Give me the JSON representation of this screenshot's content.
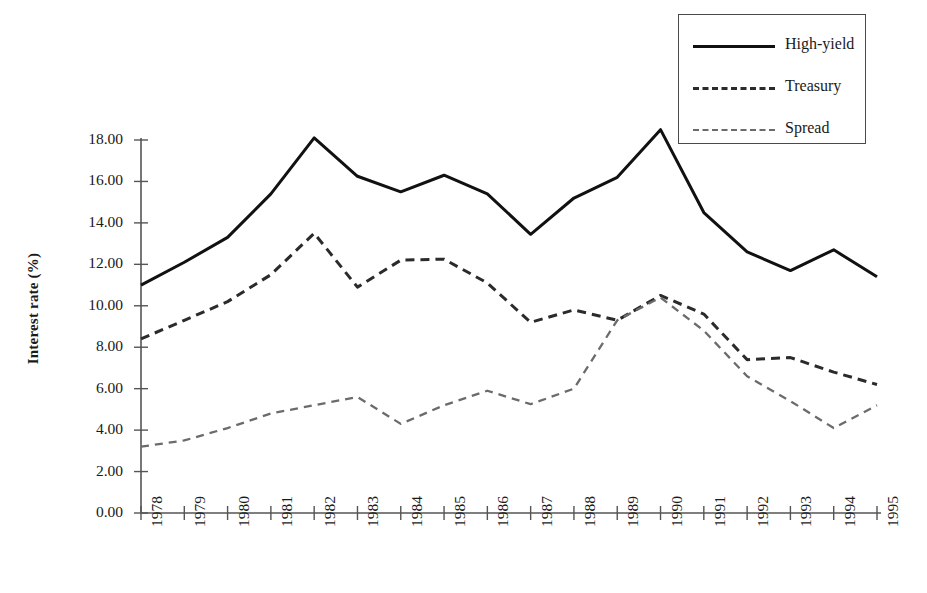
{
  "chart_data": {
    "type": "line",
    "title": "",
    "xlabel": "",
    "ylabel": "Interest rate (%)",
    "x": [
      1978,
      1979,
      1980,
      1981,
      1982,
      1983,
      1984,
      1985,
      1986,
      1987,
      1988,
      1989,
      1990,
      1991,
      1992,
      1993,
      1994,
      1995
    ],
    "categories": [
      "1978",
      "1979",
      "1980",
      "1981",
      "1982",
      "1983",
      "1984",
      "1985",
      "1986",
      "1987",
      "1988",
      "1989",
      "1990",
      "1991",
      "1992",
      "1993",
      "1994",
      "1995"
    ],
    "ylim": [
      0,
      18
    ],
    "xlim": [
      1978,
      1995
    ],
    "ytick_labels": [
      "0.00",
      "2.00",
      "4.00",
      "6.00",
      "8.00",
      "10.00",
      "12.00",
      "14.00",
      "16.00",
      "18.00"
    ],
    "ytick_values": [
      0,
      2,
      4,
      6,
      8,
      10,
      12,
      14,
      16,
      18
    ],
    "grid": false,
    "legend_position": "top-right",
    "series": [
      {
        "name": "High-yield",
        "style": "solid",
        "color": "#111111",
        "values": [
          11.0,
          12.1,
          13.3,
          15.4,
          18.1,
          16.25,
          15.5,
          16.3,
          15.4,
          13.45,
          15.2,
          16.2,
          18.5,
          14.5,
          12.6,
          11.7,
          12.7,
          11.4
        ]
      },
      {
        "name": "Treasury",
        "style": "dashed",
        "color": "#2b2b2b",
        "values": [
          8.4,
          9.3,
          10.2,
          11.5,
          13.5,
          10.9,
          12.2,
          12.25,
          11.1,
          9.2,
          9.8,
          9.3,
          10.5,
          9.6,
          7.4,
          7.5,
          6.8,
          6.2
        ]
      },
      {
        "name": "Spread",
        "style": "dashed-thin",
        "color": "#6b6b6b",
        "values": [
          3.2,
          3.5,
          4.1,
          4.8,
          5.2,
          5.6,
          4.3,
          5.2,
          5.9,
          5.25,
          6.0,
          9.3,
          10.4,
          8.8,
          6.6,
          5.4,
          4.1,
          5.2
        ]
      }
    ]
  },
  "legend": {
    "entries": [
      {
        "label": "High-yield",
        "swatch": "solid"
      },
      {
        "label": "Treasury",
        "swatch": "dashed-bold"
      },
      {
        "label": "Spread",
        "swatch": "dashed-thin"
      }
    ]
  },
  "axes": {
    "y_title": "Interest rate (%)"
  },
  "colors": {
    "high_yield": "#111111",
    "treasury": "#2b2b2b",
    "spread": "#6b6b6b",
    "axis": "#555555",
    "background": "#ffffff"
  }
}
